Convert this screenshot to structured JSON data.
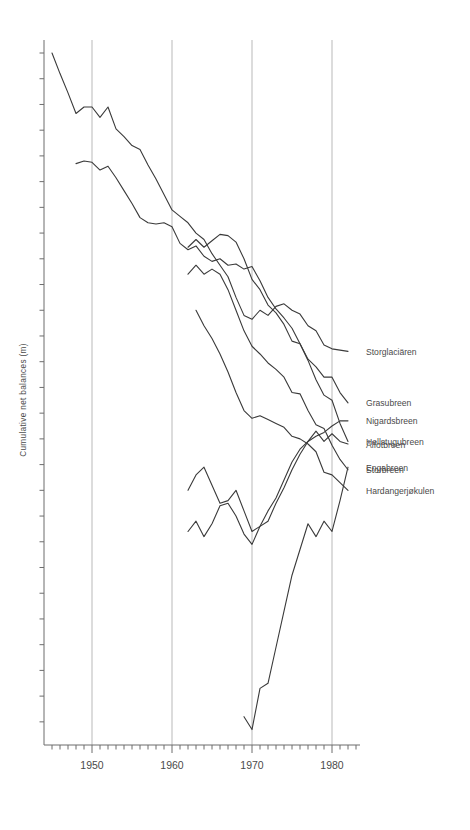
{
  "chart_data": {
    "type": "line",
    "title": "",
    "subtitle": "",
    "xlabel": "",
    "ylabel": "Cumulative net balances  (m)",
    "xlim": [
      1944,
      1983
    ],
    "ylim": [
      -27,
      2
    ],
    "grid": true,
    "grid_axis": "x",
    "grid_years": [
      1950,
      1960,
      1970,
      1980
    ],
    "legend_position": "right-inline",
    "x_major_ticks": [
      1950,
      1960,
      1970,
      1980
    ],
    "x_major_tick_labels": [
      "1950",
      "1960",
      "1970",
      "1980"
    ],
    "x_minor_tick_interval": 1,
    "y_minor_tick_interval": 1,
    "y_tick_labels": [],
    "axis_color": "#6d6d6d",
    "grid_color": "#b9b9b9",
    "line_color": "#3a3a3a",
    "series": [
      {
        "name": "Storglaciären",
        "label": "Storglaciären",
        "label_year": 1983.0,
        "label_value": -11.6,
        "x": [
          1945,
          1946,
          1947,
          1948,
          1949,
          1950,
          1951,
          1952,
          1953,
          1954,
          1955,
          1956,
          1957,
          1958,
          1959,
          1960,
          1961,
          1962,
          1963,
          1964,
          1965,
          1966,
          1967,
          1968,
          1969,
          1970,
          1971,
          1972,
          1973,
          1974,
          1975,
          1976,
          1977,
          1978,
          1979,
          1980,
          1981,
          1982
        ],
        "values": [
          0.0,
          -0.8,
          -1.55,
          -2.35,
          -2.1,
          -2.1,
          -2.5,
          -2.1,
          -2.95,
          -3.25,
          -3.6,
          -3.75,
          -4.35,
          -4.9,
          -5.5,
          -6.1,
          -6.35,
          -6.6,
          -7.0,
          -7.25,
          -7.8,
          -8.25,
          -8.7,
          -9.5,
          -10.2,
          -10.35,
          -10.0,
          -10.2,
          -9.85,
          -9.75,
          -10.0,
          -10.15,
          -10.6,
          -10.8,
          -11.35,
          -11.5,
          -11.55,
          -11.6
        ]
      },
      {
        "name": "Grasubreen",
        "label": "Grasubreen",
        "label_year": 1983.0,
        "label_value": -13.6,
        "x": [
          1948,
          1949,
          1950,
          1951,
          1952,
          1953,
          1954,
          1955,
          1956,
          1957,
          1958,
          1959,
          1960,
          1961,
          1962,
          1963,
          1964,
          1965,
          1966,
          1967,
          1968,
          1969,
          1970,
          1971,
          1972,
          1973,
          1974,
          1975,
          1976,
          1977,
          1978,
          1979,
          1980,
          1981,
          1982
        ],
        "values": [
          -4.3,
          -4.2,
          -4.25,
          -4.55,
          -4.4,
          -4.85,
          -5.35,
          -5.85,
          -6.4,
          -6.6,
          -6.65,
          -6.6,
          -6.75,
          -7.4,
          -7.65,
          -7.5,
          -7.9,
          -8.1,
          -8.0,
          -8.25,
          -8.2,
          -8.4,
          -8.3,
          -8.85,
          -9.5,
          -9.95,
          -10.3,
          -10.7,
          -11.3,
          -11.9,
          -12.2,
          -12.6,
          -12.6,
          -13.2,
          -13.6
        ]
      },
      {
        "name": "Hellstugubreen",
        "label": "Hellstugubreen",
        "label_year": 1983.0,
        "label_value": -15.1,
        "x": [
          1962,
          1963,
          1964,
          1965,
          1966,
          1967,
          1968,
          1969,
          1970,
          1971,
          1972,
          1973,
          1974,
          1975,
          1976,
          1977,
          1978,
          1979,
          1980,
          1981,
          1982
        ],
        "values": [
          -7.55,
          -7.25,
          -7.55,
          -7.3,
          -7.05,
          -7.1,
          -7.35,
          -8.0,
          -8.8,
          -9.2,
          -9.8,
          -10.1,
          -10.55,
          -11.2,
          -11.3,
          -11.95,
          -12.7,
          -13.3,
          -13.5,
          -14.4,
          -15.1
        ]
      },
      {
        "name": "Storbreen",
        "label": "Storbreen",
        "label_year": 1983.0,
        "label_value": -16.2,
        "x": [
          1962,
          1963,
          1964,
          1965,
          1966,
          1967,
          1968,
          1969,
          1970,
          1971,
          1972,
          1973,
          1974,
          1975,
          1976,
          1977,
          1978,
          1979,
          1980,
          1981,
          1982
        ],
        "values": [
          -8.6,
          -8.25,
          -8.6,
          -8.4,
          -8.6,
          -9.2,
          -10.0,
          -10.8,
          -11.4,
          -11.7,
          -12.05,
          -12.3,
          -12.6,
          -13.2,
          -13.25,
          -13.9,
          -14.45,
          -14.6,
          -15.25,
          -15.8,
          -16.2
        ]
      },
      {
        "name": "Hardangerjøkulen",
        "label": "Hardangerjøkulen",
        "label_year": 1983.0,
        "label_value": -17.0,
        "x": [
          1963,
          1964,
          1965,
          1966,
          1967,
          1968,
          1969,
          1970,
          1971,
          1972,
          1973,
          1974,
          1975,
          1976,
          1977,
          1978,
          1979,
          1980,
          1981,
          1982
        ],
        "values": [
          -10.0,
          -10.6,
          -11.1,
          -11.7,
          -12.4,
          -13.2,
          -13.9,
          -14.2,
          -14.1,
          -14.25,
          -14.4,
          -14.55,
          -14.9,
          -15.0,
          -15.2,
          -15.5,
          -16.3,
          -16.4,
          -16.7,
          -17.0
        ]
      },
      {
        "name": "Nigardsbreen",
        "label": "Nigardsbreen",
        "label_year": 1983.0,
        "label_value": -14.3,
        "x": [
          1962,
          1963,
          1964,
          1965,
          1966,
          1967,
          1968,
          1969,
          1970,
          1971,
          1972,
          1973,
          1974,
          1975,
          1976,
          1977,
          1978,
          1979,
          1980,
          1981,
          1982
        ],
        "values": [
          -18.6,
          -18.2,
          -18.8,
          -18.3,
          -17.6,
          -17.5,
          -18.0,
          -18.7,
          -19.1,
          -18.4,
          -17.8,
          -17.3,
          -16.6,
          -15.9,
          -15.4,
          -15.1,
          -14.9,
          -14.75,
          -14.5,
          -14.3,
          -14.3
        ]
      },
      {
        "name": "Ålfotbreen",
        "label": "Ålfotbreen",
        "label_year": 1983.0,
        "label_value": -15.2,
        "x": [
          1962,
          1963,
          1964,
          1965,
          1966,
          1967,
          1968,
          1969,
          1970,
          1971,
          1972,
          1973,
          1974,
          1975,
          1976,
          1977,
          1978,
          1979,
          1980,
          1981,
          1982
        ],
        "values": [
          -17.0,
          -16.4,
          -16.1,
          -16.8,
          -17.5,
          -17.4,
          -17.0,
          -17.8,
          -18.6,
          -18.4,
          -18.2,
          -17.5,
          -16.9,
          -16.2,
          -15.6,
          -15.1,
          -14.7,
          -15.1,
          -14.8,
          -15.1,
          -15.2
        ]
      },
      {
        "name": "Engabreen",
        "label": "Engabreen",
        "label_year": 1983.0,
        "label_value": -16.1,
        "x": [
          1969,
          1970,
          1971,
          1972,
          1973,
          1974,
          1975,
          1976,
          1977,
          1978,
          1979,
          1980,
          1981,
          1982
        ],
        "values": [
          -25.8,
          -26.3,
          -24.7,
          -24.5,
          -23.1,
          -21.7,
          -20.3,
          -19.3,
          -18.3,
          -18.8,
          -18.2,
          -18.6,
          -17.4,
          -16.1
        ]
      }
    ]
  },
  "axis": {
    "ylabel": "Cumulative net balances  (m)",
    "x_tick_labels": [
      "1950",
      "1960",
      "1970",
      "1980"
    ]
  },
  "labels": {
    "storglaciaren": "Storglaciären",
    "grasubreen": "Grasubreen",
    "hellstugubreen": "Hellstugubreen",
    "storbreen": "Storbreen",
    "hardangerjokulen": "Hardangerjøkulen",
    "nigardsbreen": "Nigardsbreen",
    "alfotbreen": "Ålfotbreen",
    "engabreen": "Engabreen"
  }
}
